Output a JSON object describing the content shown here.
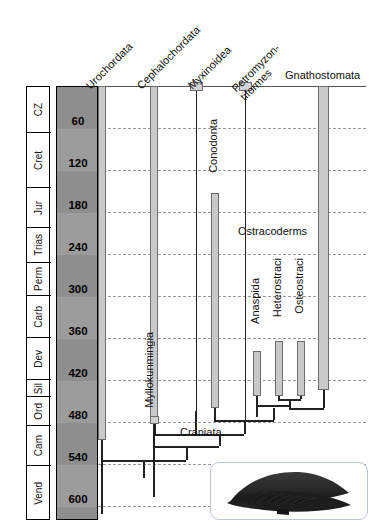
{
  "figure": {
    "type": "phylogeny-stratigraphic-range-chart",
    "time_axis_unit": "Ma",
    "time_axis_range": [
      0,
      620
    ],
    "time_axis_direction": "top-is-recent"
  },
  "time_scale": {
    "column_header": "",
    "tick_labels": [
      "60",
      "120",
      "180",
      "240",
      "300",
      "360",
      "420",
      "480",
      "540",
      "600"
    ],
    "tick_values": [
      60,
      120,
      180,
      240,
      300,
      360,
      420,
      480,
      540,
      600
    ],
    "gridlines": true,
    "band_shading": [
      "dark",
      "light",
      "dark",
      "light",
      "dark",
      "light",
      "dark",
      "light",
      "dark",
      "light"
    ]
  },
  "periods": [
    {
      "label": "CZ",
      "start": 0,
      "end": 66
    },
    {
      "label": "Cret",
      "start": 66,
      "end": 145
    },
    {
      "label": "Jur",
      "start": 145,
      "end": 201
    },
    {
      "label": "Trias",
      "start": 201,
      "end": 252
    },
    {
      "label": "Perm",
      "start": 252,
      "end": 299
    },
    {
      "label": "Carb",
      "start": 299,
      "end": 359
    },
    {
      "label": "Dev",
      "start": 359,
      "end": 419
    },
    {
      "label": "Sil",
      "start": 419,
      "end": 443
    },
    {
      "label": "Ord",
      "start": 443,
      "end": 485
    },
    {
      "label": "Cam",
      "start": 485,
      "end": 541
    },
    {
      "label": "Vend",
      "start": 541,
      "end": 620
    }
  ],
  "taxa": [
    {
      "name": "Urochordata",
      "label_style": "diagonal",
      "kind": "extant-range-bar",
      "top": 0,
      "bottom": 540
    },
    {
      "name": "Cephalochordata",
      "label_style": "diagonal",
      "kind": "extant-range-bar",
      "top": 0,
      "bottom": 512
    },
    {
      "name": "Myxinoidea",
      "label_style": "diagonal",
      "kind": "extant-capped-stem",
      "top": 0,
      "bottom": 500
    },
    {
      "name": "Petromyzontiformes",
      "label_style": "diagonal-two-line",
      "line1": "Petromyzon-",
      "line2": "tiformes",
      "kind": "extant-capped-stem",
      "top": 0,
      "bottom": 500
    },
    {
      "name": "Gnathostomata",
      "label_style": "horizontal",
      "kind": "extant-range-bar",
      "top": 0,
      "bottom": 495
    }
  ],
  "fossil_taxa": [
    {
      "name": "Myllokunmingia",
      "label_style": "vertical",
      "kind": "point-occurrence",
      "age": 525
    },
    {
      "name": "Conodonta",
      "label_style": "vertical",
      "kind": "range-bar",
      "top": 240,
      "bottom": 520
    },
    {
      "name": "Anaspida",
      "label_style": "vertical",
      "kind": "range-bar",
      "top": 428,
      "bottom": 470
    },
    {
      "name": "Heterostraci",
      "label_style": "vertical",
      "kind": "range-bar",
      "top": 420,
      "bottom": 478
    },
    {
      "name": "Osteostraci",
      "label_style": "vertical",
      "kind": "range-bar",
      "top": 420,
      "bottom": 478
    }
  ],
  "clade_labels": [
    {
      "name": "Ostracoderms",
      "label_style": "horizontal"
    },
    {
      "name": "Craniata",
      "label_style": "horizontal"
    }
  ],
  "inset": {
    "caption": "",
    "depicts": "fossil-ostracoderm-silhouette",
    "silhouette_color": "#2b2b2b"
  },
  "colors": {
    "range_bar_fill": "#c9c9c9",
    "range_bar_stroke": "#6e6e6e",
    "branch_line": "#222222",
    "gridline": "#9a9a9a",
    "scale_band_dark": "#8e8e8e",
    "scale_band_light": "#9c9c9c",
    "text": "#111111"
  }
}
